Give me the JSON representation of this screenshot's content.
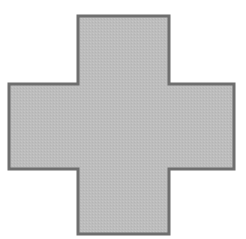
{
  "diagram": {
    "shape": "cross",
    "fill_color": "#bdbdbd",
    "stroke_color": "#6e6e6e",
    "stroke_width": 3,
    "vertical_bar": {
      "x1": 78,
      "x2": 169,
      "y1": 16,
      "y2": 234
    },
    "horizontal_bar": {
      "x1": 9,
      "x2": 234,
      "y1": 84,
      "y2": 169
    },
    "points": "78,16 169,16 169,84 234,84 234,169 169,169 169,234 78,234 78,169 9,169 9,84 78,84"
  }
}
